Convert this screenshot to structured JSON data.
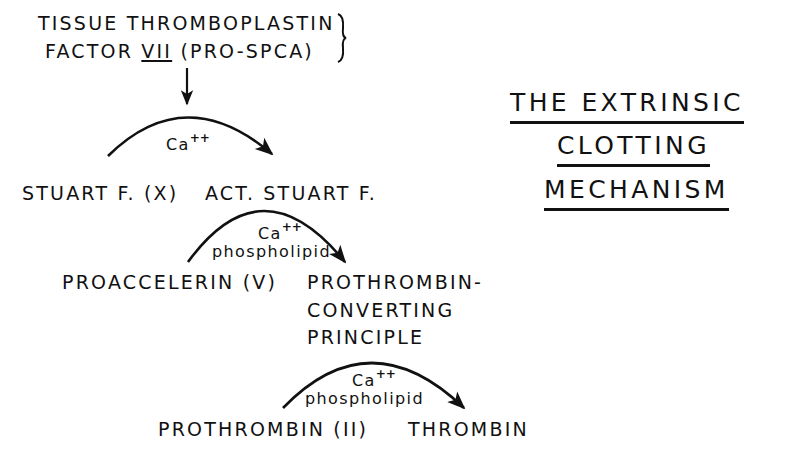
{
  "title": {
    "line1": "THE EXTRINSIC",
    "line2": "CLOTTING",
    "line3": "MECHANISM"
  },
  "initiators": {
    "tissue_thromboplastin": "TISSUE THROMBOPLASTIN",
    "factor_prefix": "FACTOR ",
    "factor_numeral": "VII",
    "factor_suffix": " (PRO-SPCA)"
  },
  "step1": {
    "cofactor": "Ca",
    "cofactor_charge": "++",
    "substrate": "STUART F. (X)",
    "product": "ACT. STUART F."
  },
  "step2": {
    "cofactor": "Ca",
    "cofactor_charge": "++",
    "cofactor2": "phospholipid",
    "substrate": "PROACCELERIN (V)",
    "product_line1": "PROTHROMBIN-",
    "product_line2": "CONVERTING",
    "product_line3": "PRINCIPLE"
  },
  "step3": {
    "cofactor": "Ca",
    "cofactor_charge": "++",
    "cofactor2": "phospholipid",
    "substrate": "PROTHROMBIN (II)",
    "product": "THROMBIN"
  },
  "colors": {
    "ink": "#111111",
    "background": "#ffffff"
  }
}
